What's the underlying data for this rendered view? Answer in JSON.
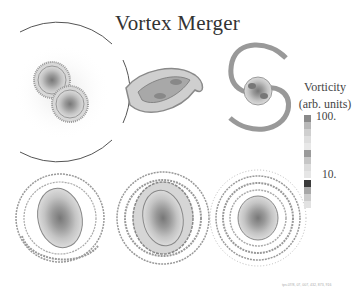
{
  "title": "Vortex Merger",
  "legend": {
    "line1": "Vorticity",
    "line2": "(arb. units)",
    "ticks": [
      {
        "label": "100.",
        "position": "top"
      },
      {
        "label": "10.",
        "position": "lower"
      }
    ],
    "colors": [
      "#8a8a8a",
      "#b8b8b8",
      "#cfcfcf",
      "#dedede",
      "#e8e8e8",
      "#9a9a9a",
      "#c6c6c6",
      "#dcdcdc",
      "#e6e6e6",
      "#3a3a3a",
      "#a8a8a8",
      "#cccccc",
      "#e2e2e2"
    ]
  },
  "panels": [
    {
      "id": "panel-1",
      "stage": "two separate vortices"
    },
    {
      "id": "panel-2",
      "stage": "elongated S-shape"
    },
    {
      "id": "panel-3",
      "stage": "spiral arms forming"
    },
    {
      "id": "panel-4",
      "stage": "elliptical core with spiral arms"
    },
    {
      "id": "panel-5",
      "stage": "core with surrounding filaments"
    },
    {
      "id": "panel-6",
      "stage": "axisymmetric merged vortex"
    }
  ],
  "caption": "tps.07/8, 07, 007, 432, 873, 916"
}
